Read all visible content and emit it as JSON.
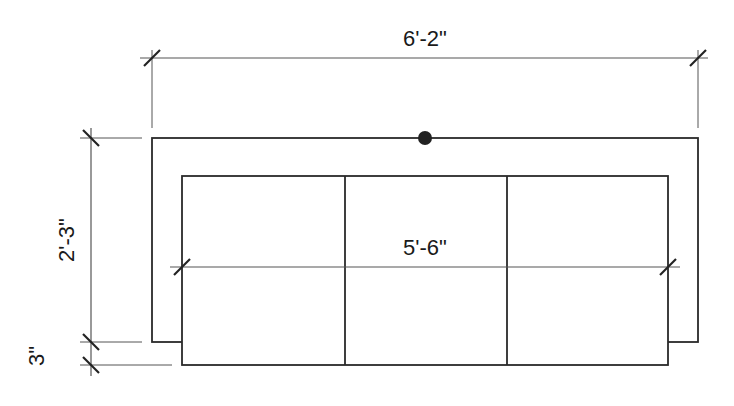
{
  "drawing": {
    "subject": "sofa plan view",
    "dimensions": {
      "overall_width": "6'-2\"",
      "cushion_width": "5'-6\"",
      "overall_depth": "2'-3\"",
      "base_offset": "3\""
    },
    "cushion_count": 3,
    "colors": {
      "line": "#2a2a2a",
      "dim_line": "#555555",
      "background": "#ffffff"
    }
  }
}
